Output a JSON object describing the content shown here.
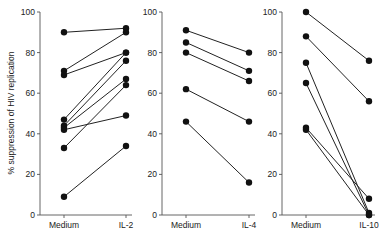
{
  "chart_data": {
    "type": "line",
    "ylabel": "% suppression of HIV replication",
    "ylim": [
      0,
      100
    ],
    "yticks": [
      0,
      20,
      40,
      60,
      80,
      100
    ],
    "grid": false,
    "legend": null,
    "panels": [
      {
        "categories": [
          "Medium",
          "IL-2"
        ],
        "series": [
          {
            "name": "donor 1",
            "values": [
              90,
              92
            ]
          },
          {
            "name": "donor 2",
            "values": [
              71,
              90
            ]
          },
          {
            "name": "donor 3",
            "values": [
              69,
              80
            ]
          },
          {
            "name": "donor 4",
            "values": [
              47,
              80
            ]
          },
          {
            "name": "donor 5",
            "values": [
              44,
              76
            ]
          },
          {
            "name": "donor 6",
            "values": [
              43,
              67
            ]
          },
          {
            "name": "donor 7",
            "values": [
              42,
              49
            ]
          },
          {
            "name": "donor 8",
            "values": [
              33,
              64
            ]
          },
          {
            "name": "donor 9",
            "values": [
              9,
              34
            ]
          }
        ]
      },
      {
        "categories": [
          "Medium",
          "IL-4"
        ],
        "series": [
          {
            "name": "donor 1",
            "values": [
              91,
              80
            ]
          },
          {
            "name": "donor 2",
            "values": [
              85,
              71
            ]
          },
          {
            "name": "donor 3",
            "values": [
              80,
              66
            ]
          },
          {
            "name": "donor 4",
            "values": [
              62,
              46
            ]
          },
          {
            "name": "donor 5",
            "values": [
              46,
              16
            ]
          }
        ]
      },
      {
        "categories": [
          "Medium",
          "IL-10"
        ],
        "series": [
          {
            "name": "donor 1",
            "values": [
              100,
              76
            ]
          },
          {
            "name": "donor 2",
            "values": [
              88,
              56
            ]
          },
          {
            "name": "donor 3",
            "values": [
              75,
              1
            ]
          },
          {
            "name": "donor 4",
            "values": [
              65,
              0
            ]
          },
          {
            "name": "donor 5",
            "values": [
              43,
              8
            ]
          },
          {
            "name": "donor 6",
            "values": [
              42,
              0
            ]
          }
        ]
      }
    ]
  },
  "layout": {
    "panel_axis_x": [
      40,
      162,
      282
    ],
    "panel_cat_x": [
      [
        64,
        126
      ],
      [
        186,
        249
      ],
      [
        306,
        369
      ]
    ],
    "y_top": 12,
    "y_bottom": 215
  }
}
